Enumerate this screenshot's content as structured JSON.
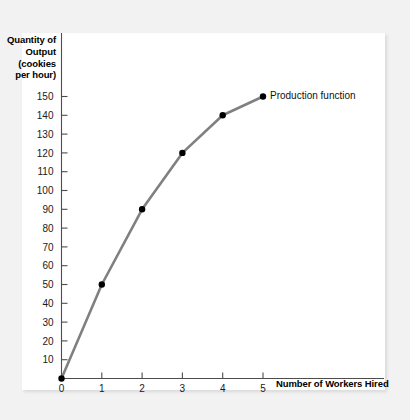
{
  "chart_data": {
    "type": "line",
    "title": "",
    "ylabel": "Quantity of Output (cookies per hour)",
    "ylabel_lines": [
      "Quantity of",
      "Output",
      "(cookies",
      "per hour)"
    ],
    "xlabel": "Number of Workers Hired",
    "x": [
      0,
      1,
      2,
      3,
      4,
      5
    ],
    "values": [
      0,
      50,
      90,
      120,
      140,
      150
    ],
    "categories": [
      "0",
      "1",
      "2",
      "3",
      "4",
      "5"
    ],
    "series": [
      {
        "name": "Production function",
        "values": [
          0,
          50,
          90,
          120,
          140,
          150
        ]
      }
    ],
    "annotations": [
      {
        "text": "Production function",
        "x": 5,
        "y": 150
      }
    ],
    "xlim": [
      0,
      6.4
    ],
    "ylim": [
      0,
      160
    ],
    "xticks": [
      0,
      1,
      2,
      3,
      4,
      5
    ],
    "xtick_labels": [
      "0",
      "1",
      "2",
      "3",
      "4",
      "5"
    ],
    "yticks": [
      10,
      20,
      30,
      40,
      50,
      60,
      70,
      80,
      90,
      100,
      110,
      120,
      130,
      140,
      150
    ],
    "ytick_labels": [
      "10",
      "20",
      "30",
      "40",
      "50",
      "60",
      "70",
      "80",
      "90",
      "100",
      "110",
      "120",
      "130",
      "140",
      "150"
    ],
    "grid": false,
    "legend": "none",
    "colors": {
      "line": "#808080",
      "point": "#000000",
      "axis": "#4d4d4d",
      "panel_background": "#ffffff",
      "page_background": "#f2f2f2",
      "text": "#000000"
    }
  }
}
